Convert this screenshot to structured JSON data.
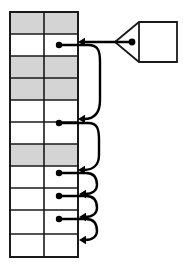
{
  "diagram": {
    "title": "Hash table with separate chaining",
    "canvas": {
      "width": 183,
      "height": 270,
      "background": "#ffffff"
    },
    "colors": {
      "stroke": "#1a1a1a",
      "cell_shaded": "#d4d4d4",
      "cell_empty": "#ffffff",
      "pointer": "#000000",
      "node_fill": "#ffffff"
    },
    "table": {
      "label": "bucket-array",
      "x": 10,
      "y": 12,
      "width": 68,
      "height": 245,
      "columns": 2,
      "column_divider_x": 44,
      "row_count": 11,
      "row_boundaries": [
        12,
        34,
        56,
        78,
        100,
        122,
        144,
        166,
        188,
        210,
        234,
        257
      ],
      "rows": [
        {
          "index": 0,
          "shaded": true,
          "has_pointer": false
        },
        {
          "index": 1,
          "shaded": false,
          "has_pointer": true
        },
        {
          "index": 2,
          "shaded": true,
          "has_pointer": false
        },
        {
          "index": 3,
          "shaded": true,
          "has_pointer": false
        },
        {
          "index": 4,
          "shaded": false,
          "has_pointer": false
        },
        {
          "index": 5,
          "shaded": false,
          "has_pointer": true
        },
        {
          "index": 6,
          "shaded": true,
          "has_pointer": false
        },
        {
          "index": 7,
          "shaded": false,
          "has_pointer": true
        },
        {
          "index": 8,
          "shaded": false,
          "has_pointer": true
        },
        {
          "index": 9,
          "shaded": false,
          "has_pointer": true
        },
        {
          "index": 10,
          "shaded": false,
          "has_pointer": false
        }
      ]
    },
    "pointer_dots": [
      {
        "id": "dot-1",
        "cx": 59,
        "cy": 45,
        "r": 3.2
      },
      {
        "id": "dot-2",
        "cx": 59,
        "cy": 123,
        "r": 3.2
      },
      {
        "id": "dot-3",
        "cx": 59,
        "cy": 173,
        "r": 3.2
      },
      {
        "id": "dot-4",
        "cx": 59,
        "cy": 196,
        "r": 3.2
      },
      {
        "id": "dot-5",
        "cx": 59,
        "cy": 219,
        "r": 3.2
      }
    ],
    "links": [
      {
        "id": "link-1",
        "from_dot": "dot-1",
        "path": "M 59 45 L 88 45 C 99 45 100 52 100 62 L 100 100 C 100 113 94 119 84 119",
        "arrow_at": {
          "x": 78,
          "y": 119,
          "direction": "left"
        }
      },
      {
        "id": "link-2",
        "from_dot": "dot-2",
        "path": "M 59 123 L 88 123 C 98 123 99 130 99 140 L 99 155 C 99 165 93 170 84 170",
        "arrow_at": {
          "x": 78,
          "y": 170,
          "direction": "left"
        }
      },
      {
        "id": "link-3",
        "from_dot": "dot-3",
        "path": "M 59 173 L 86 173 C 96 173 97 180 97 185 C 97 190 93 194 85 194",
        "arrow_at": {
          "x": 79,
          "y": 194,
          "direction": "left"
        }
      },
      {
        "id": "link-4",
        "from_dot": "dot-4",
        "path": "M 59 196 L 86 196 C 96 196 97 203 97 208 C 97 213 93 217 85 217",
        "arrow_at": {
          "x": 79,
          "y": 217,
          "direction": "left"
        }
      },
      {
        "id": "link-5",
        "from_dot": "dot-5",
        "path": "M 59 219 L 86 219 C 96 219 97 226 97 231 C 97 236 93 240 85 240",
        "arrow_at": {
          "x": 79,
          "y": 240,
          "direction": "left"
        }
      }
    ],
    "external_node": {
      "label": "external-record-node",
      "box": {
        "x": 139,
        "y": 22,
        "width": 38,
        "height": 40
      },
      "tip": {
        "x": 115,
        "y": 42
      },
      "dot": {
        "cx": 132,
        "cy": 42,
        "r": 3.4
      }
    },
    "external_edge": {
      "label": "external-pointer-edge",
      "path": "M 130 42 L 84 42",
      "arrow_at": {
        "x": 78,
        "y": 42,
        "direction": "left"
      }
    }
  }
}
